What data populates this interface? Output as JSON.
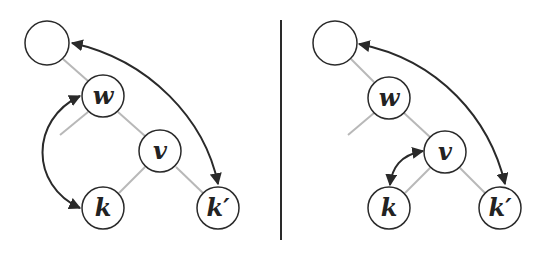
{
  "figure": {
    "panels": [
      {
        "id": "left",
        "nodes": [
          {
            "id": "root",
            "label": ""
          },
          {
            "id": "w",
            "label": "w"
          },
          {
            "id": "v",
            "label": "v"
          },
          {
            "id": "k",
            "label": "k"
          },
          {
            "id": "kprime",
            "label": "k′"
          }
        ],
        "tree_edges": [
          [
            "root",
            "w"
          ],
          [
            "w",
            "v"
          ],
          [
            "v",
            "k"
          ],
          [
            "v",
            "kprime"
          ],
          [
            "w",
            "stub"
          ]
        ],
        "arrows": [
          [
            "w",
            "k"
          ],
          [
            "root",
            "kprime"
          ]
        ]
      },
      {
        "id": "right",
        "nodes": [
          {
            "id": "root",
            "label": ""
          },
          {
            "id": "w",
            "label": "w"
          },
          {
            "id": "v",
            "label": "v"
          },
          {
            "id": "k",
            "label": "k"
          },
          {
            "id": "kprime",
            "label": "k′"
          }
        ],
        "tree_edges": [
          [
            "root",
            "w"
          ],
          [
            "w",
            "v"
          ],
          [
            "v",
            "k"
          ],
          [
            "v",
            "kprime"
          ],
          [
            "w",
            "stub"
          ]
        ],
        "arrows": [
          [
            "v",
            "k"
          ],
          [
            "root",
            "kprime"
          ]
        ]
      }
    ],
    "colors": {
      "node_stroke": "#2a2a2a",
      "tree_edge": "#b8b8b8",
      "arrow": "#2a2a2a"
    }
  }
}
